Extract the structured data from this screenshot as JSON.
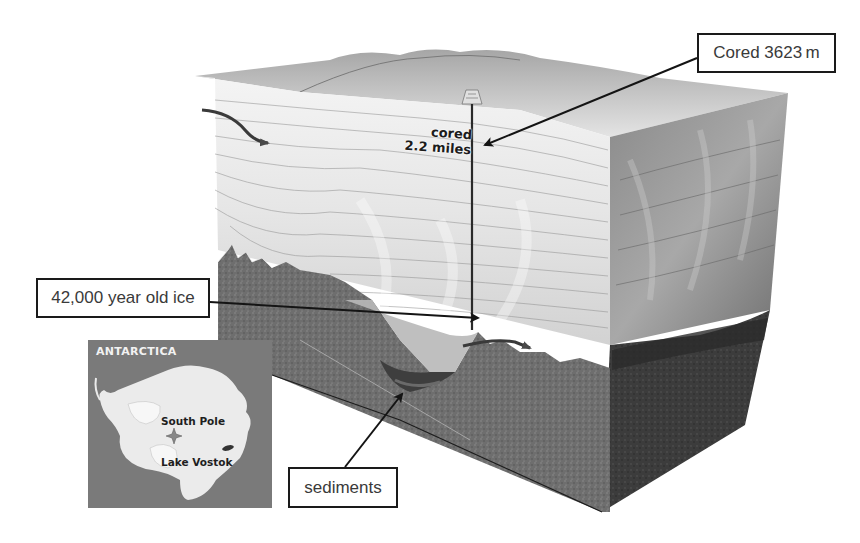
{
  "figure": {
    "type": "block-diagram cross-section"
  },
  "callouts": {
    "cored_depth": "Cored 3623 m",
    "old_ice": "42,000 year old ice",
    "sediments": "sediments"
  },
  "in_diagram_labels": {
    "cored_line1": "cored",
    "cored_line2": "2.2 miles"
  },
  "inset_map": {
    "title": "ANTARCTICA",
    "labels": {
      "south_pole": "South Pole",
      "lake_vostok": "Lake Vostok"
    },
    "icons": {
      "pole_marker": "star-cross-marker",
      "lake": "lake-blob"
    }
  },
  "caption": {
    "text": "",
    "note": "caption clipped at bottom edge; illegible"
  },
  "colors": {
    "background": "#ffffff",
    "ice_light": "#ececec",
    "ice_mid": "#c9c9c9",
    "rock_front": "#6d6d6d",
    "rock_side": "#3a3a3a",
    "map_ocean": "#7a7a7a",
    "map_land": "#ebebeb",
    "arrow": "#141414"
  }
}
